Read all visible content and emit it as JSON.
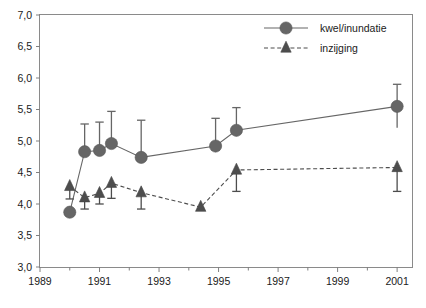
{
  "chart_data": {
    "type": "line",
    "title": "",
    "subtitle": "",
    "xlabel": "",
    "ylabel": "",
    "xlim": [
      1989,
      2001.5
    ],
    "ylim": [
      3.0,
      7.0
    ],
    "grid": false,
    "legend_position": "top-right",
    "x_ticks_major": [
      "1989",
      "1991",
      "1993",
      "1995",
      "1997",
      "1999",
      "2001"
    ],
    "x_tick_values_major": [
      1989,
      1991,
      1993,
      1995,
      1997,
      1999,
      2001
    ],
    "x_tick_values_minor": [
      1990,
      1992,
      1994,
      1996,
      1998,
      2000
    ],
    "y_ticks": [
      "3,0",
      "3,5",
      "4,0",
      "4,5",
      "5,0",
      "5,5",
      "6,0",
      "6,5",
      "7,0"
    ],
    "y_tick_values": [
      3.0,
      3.5,
      4.0,
      4.5,
      5.0,
      5.5,
      6.0,
      6.5,
      7.0
    ],
    "series": [
      {
        "name": "kwel/inundatie",
        "marker": "circle",
        "linestyle": "solid",
        "color": "#666666",
        "x": [
          1990.0,
          1990.5,
          1991.0,
          1991.4,
          1992.4,
          1994.9,
          1995.6,
          2001.0
        ],
        "values": [
          3.87,
          4.83,
          4.85,
          4.96,
          4.74,
          4.92,
          5.17,
          5.55
        ],
        "err_upper": [
          3.87,
          5.27,
          5.3,
          5.47,
          5.33,
          5.36,
          5.53,
          5.9
        ],
        "err_lower": [
          3.87,
          4.83,
          4.85,
          4.96,
          4.74,
          4.92,
          5.17,
          5.21
        ]
      },
      {
        "name": "inzijging",
        "marker": "triangle",
        "linestyle": "dashed",
        "color": "#4d4d4d",
        "x": [
          1990.0,
          1990.5,
          1991.0,
          1991.4,
          1992.4,
          1994.4,
          1995.6,
          2001.0
        ],
        "values": [
          4.28,
          4.1,
          4.17,
          4.33,
          4.18,
          3.95,
          4.54,
          4.58
        ],
        "err_upper": [
          4.28,
          4.1,
          4.17,
          4.33,
          4.18,
          3.95,
          4.54,
          4.58
        ],
        "err_lower": [
          4.08,
          3.92,
          4.0,
          4.09,
          3.92,
          3.95,
          4.2,
          4.2
        ]
      }
    ]
  },
  "legend": {
    "entries": [
      {
        "label": "kwel/inundatie",
        "marker": "circle-marker",
        "line": "solid-line"
      },
      {
        "label": "inzijging",
        "marker": "triangle-marker",
        "line": "dashed-line"
      }
    ]
  },
  "colors": {
    "series_primary": "#666666",
    "series_secondary": "#4d4d4d",
    "axis": "#808080",
    "text": "#1a1a1a"
  }
}
